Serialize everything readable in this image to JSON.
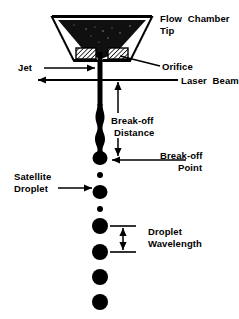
{
  "figure": {
    "title_present": false,
    "background_color": "#ffffff",
    "ink_color": "#000000"
  },
  "labels": {
    "flow_chamber_tip_line1": "Flow  Chamber",
    "flow_chamber_tip_line2": "Tip",
    "orifice": "Orifice",
    "jet": "Jet",
    "laser_beam": "Laser  Beam",
    "break_off_distance_line1": "Break-off",
    "break_off_distance_line2": "Distance",
    "break_off_point_line1": "Break-off",
    "break_off_point_line2": "Point",
    "satellite_droplet_line1": "Satellite",
    "satellite_droplet_line2": "Droplet",
    "droplet_wavelength_line1": "Droplet",
    "droplet_wavelength_line2": "Wavelength"
  },
  "geometry": {
    "chamber": {
      "top_y": 17,
      "top_left_x": 52,
      "top_right_x": 152,
      "bottom_y": 61,
      "bottom_left_x": 74,
      "bottom_right_x": 130,
      "wall_thickness": 7
    },
    "orifice_blocks": {
      "left": {
        "x": 76,
        "y": 48,
        "w": 20,
        "h": 11
      },
      "right": {
        "x": 108,
        "y": 48,
        "w": 20,
        "h": 11
      },
      "hatch_spacing": 3
    },
    "jet": {
      "center_x": 100,
      "top_y": 59,
      "straight_to_y": 104,
      "break_off_y": 158,
      "width": 5
    },
    "laser_beam_y": 80,
    "droplets": [
      {
        "cy": 158,
        "r": 7,
        "kind": "main"
      },
      {
        "cy": 175,
        "r": 3,
        "kind": "satellite"
      },
      {
        "cy": 192,
        "r": 7,
        "kind": "main"
      },
      {
        "cy": 209,
        "r": 3,
        "kind": "satellite"
      },
      {
        "cy": 226,
        "r": 8,
        "kind": "main"
      },
      {
        "cy": 252,
        "r": 8,
        "kind": "main"
      },
      {
        "cy": 277,
        "r": 8,
        "kind": "main"
      },
      {
        "cy": 302,
        "r": 8,
        "kind": "main"
      }
    ],
    "droplet_wavelength_span": {
      "top_y": 226,
      "bottom_y": 252
    },
    "break_off_distance_span": {
      "top_y": 80,
      "bottom_y": 158
    }
  },
  "annotations": {
    "arrows": [
      {
        "name": "jet-arrow",
        "direction": "right"
      },
      {
        "name": "laser-beam-arrow",
        "direction": "left"
      },
      {
        "name": "orifice-leader",
        "direction": "left"
      },
      {
        "name": "break-off-distance-arrow",
        "direction": "both-vertical"
      },
      {
        "name": "break-off-point-arrow",
        "direction": "left"
      },
      {
        "name": "satellite-droplet-arrow",
        "direction": "right"
      },
      {
        "name": "droplet-wavelength-arrow",
        "direction": "both-vertical"
      }
    ]
  }
}
